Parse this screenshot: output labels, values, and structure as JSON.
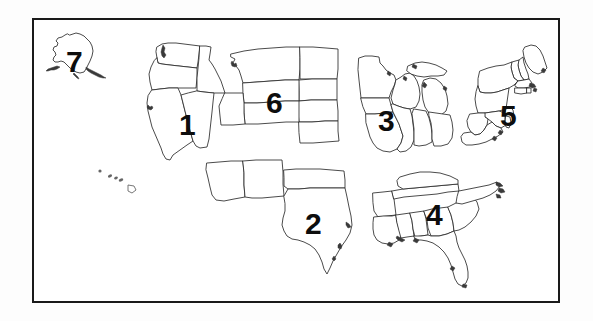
{
  "image": {
    "kind": "map",
    "title": "United States regional map with numbered regions",
    "background_color": "#ffffff",
    "ink_color": "#1a1a1a"
  },
  "frame": {
    "name": "map-border",
    "border_color": "#1a1a1a",
    "border_width_px": 2.5,
    "x": 32,
    "y": 18,
    "width": 528,
    "height": 285
  },
  "regions": [
    {
      "number": "1",
      "name": "region-1-west",
      "label_x": 179,
      "label_y": 110,
      "font_size": 30,
      "states": [
        "Washington",
        "Oregon",
        "Idaho",
        "California",
        "Nevada"
      ]
    },
    {
      "number": "2",
      "name": "region-2-southwest",
      "label_x": 305,
      "label_y": 209,
      "font_size": 30,
      "states": [
        "Arizona",
        "New Mexico",
        "Oklahoma",
        "Texas"
      ]
    },
    {
      "number": "3",
      "name": "region-3-midwest",
      "label_x": 378,
      "label_y": 106,
      "font_size": 30,
      "states": [
        "Minnesota",
        "Iowa",
        "Missouri",
        "Wisconsin",
        "Illinois",
        "Michigan",
        "Indiana",
        "Ohio"
      ]
    },
    {
      "number": "4",
      "name": "region-4-southeast",
      "label_x": 426,
      "label_y": 200,
      "font_size": 30,
      "states": [
        "Arkansas",
        "Louisiana",
        "Mississippi",
        "Alabama",
        "Tennessee",
        "Kentucky",
        "Georgia",
        "Florida",
        "South Carolina",
        "North Carolina"
      ]
    },
    {
      "number": "5",
      "name": "region-5-northeast",
      "label_x": 500,
      "label_y": 101,
      "font_size": 30,
      "states": [
        "Maine",
        "New Hampshire",
        "Vermont",
        "Massachusetts",
        "Rhode Island",
        "Connecticut",
        "New York",
        "Pennsylvania",
        "New Jersey",
        "Delaware",
        "Maryland",
        "Virginia",
        "West Virginia"
      ]
    },
    {
      "number": "6",
      "name": "region-6-plains",
      "label_x": 266,
      "label_y": 88,
      "font_size": 30,
      "states": [
        "Montana",
        "Wyoming",
        "Colorado",
        "Utah",
        "North Dakota",
        "South Dakota",
        "Nebraska",
        "Kansas"
      ]
    },
    {
      "number": "7",
      "name": "region-7-alaska",
      "label_x": 66,
      "label_y": 47,
      "font_size": 30,
      "states": [
        "Alaska"
      ]
    }
  ],
  "insets": [
    {
      "name": "alaska-inset",
      "label": "Alaska"
    },
    {
      "name": "hawaii-inset",
      "label": "Hawaii"
    }
  ]
}
